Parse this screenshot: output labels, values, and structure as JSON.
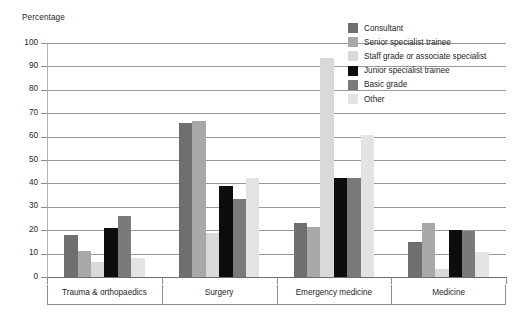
{
  "chart_data": {
    "type": "bar",
    "title": "",
    "subtitle": "",
    "xlabel": "",
    "ylabel": "Percentage",
    "ylim": [
      0,
      100
    ],
    "yticks": [
      0,
      10,
      20,
      30,
      40,
      50,
      60,
      70,
      80,
      90,
      100
    ],
    "ytick_labels": [
      "0",
      "10",
      "20",
      "30",
      "40",
      "50",
      "60",
      "70",
      "80",
      "90",
      "100"
    ],
    "grid": true,
    "legend_position": "top-right",
    "categories": [
      "Trauma & orthopaedics",
      "Surgery",
      "Emergency medicine",
      "Medicine"
    ],
    "series": [
      {
        "name": "Consultant",
        "color": "#6f6f6f",
        "values": [
          18,
          66,
          23,
          15
        ]
      },
      {
        "name": "Senior specialist trainee",
        "color": "#a8a8a8",
        "values": [
          11,
          66.5,
          21.5,
          23
        ]
      },
      {
        "name": "Staff grade or associate specialist",
        "color": "#d9d9d9",
        "values": [
          6.5,
          19,
          93.5,
          3.5
        ]
      },
      {
        "name": "Junior specialist trainee",
        "color": "#0d0d0d",
        "values": [
          21,
          39,
          42.5,
          20
        ]
      },
      {
        "name": "Basic grade",
        "color": "#7a7a7a",
        "values": [
          26,
          33.5,
          42.5,
          19.5
        ]
      },
      {
        "name": "Other",
        "color": "#e3e3e3",
        "values": [
          8,
          42.5,
          60.5,
          10.5
        ]
      }
    ]
  },
  "axis": {
    "y_title": "Percentage"
  },
  "colors": {
    "grid": "#9a9a9a",
    "axis": "#6d6d6d",
    "text": "#231f20",
    "background": "#ffffff"
  }
}
